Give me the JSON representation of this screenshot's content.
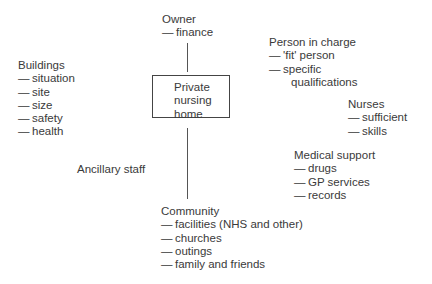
{
  "diagram": {
    "center": {
      "lines": [
        "Private",
        "nursing",
        "home"
      ]
    },
    "owner": {
      "title": "Owner",
      "items": [
        "finance"
      ]
    },
    "person_in_charge": {
      "title": "Person in charge",
      "items": [
        "'fit' person",
        "specific"
      ],
      "continuation": "qualifications"
    },
    "buildings": {
      "title": "Buildings",
      "items": [
        "situation",
        "site",
        "size",
        "safety",
        "health"
      ]
    },
    "nurses": {
      "title": "Nurses",
      "items": [
        "sufficient",
        "skills"
      ]
    },
    "medical_support": {
      "title": "Medical support",
      "items": [
        "drugs",
        "GP services",
        "records"
      ]
    },
    "ancillary_staff": {
      "title": "Ancillary staff"
    },
    "community": {
      "title": "Community",
      "items": [
        "facilities (NHS and other)",
        "churches",
        "outings",
        "family and friends"
      ]
    },
    "dash": "—"
  }
}
